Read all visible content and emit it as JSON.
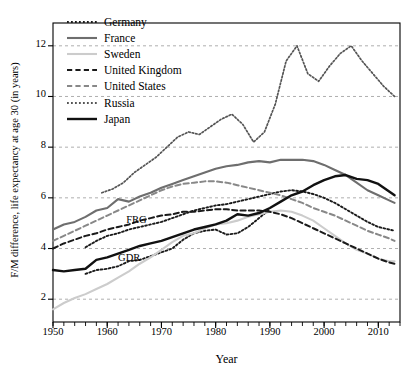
{
  "chart_data": {
    "type": "line",
    "title": "",
    "xlabel": "Year",
    "ylabel": "F/M difference, life expectancy at age 30 (in years)",
    "xlim": [
      1950,
      2014
    ],
    "ylim": [
      1.1,
      12.9
    ],
    "xticks": [
      1950,
      1960,
      1970,
      1980,
      1990,
      2000,
      2010
    ],
    "xtick_labels": [
      "1950",
      "1960",
      "1970",
      "1980",
      "1990",
      "2000",
      "2010"
    ],
    "yticks": [
      2,
      4,
      6,
      8,
      10,
      12
    ],
    "ytick_labels": [
      "2",
      "4",
      "6",
      "8",
      "10",
      "12"
    ],
    "minor_xtick_step": 2,
    "grid": "horizontal-dashed",
    "legend_position": "top-left-inside",
    "annotations": [
      {
        "text": "FRG",
        "x": 1963.5,
        "y": 5.05
      },
      {
        "text": "GDR",
        "x": 1962.0,
        "y": 3.55
      }
    ],
    "series": [
      {
        "name": "Germany",
        "style": "dotted",
        "color": "#1a1a1a",
        "width": 1.9,
        "note": "two branches before reunification: FRG (upper) and GDR (lower)",
        "x": [
          1956,
          1958,
          1960,
          1962,
          1964,
          1966,
          1968,
          1970,
          1972,
          1974,
          1976,
          1978,
          1980,
          1982,
          1984,
          1986,
          1988,
          1990,
          1992,
          1994,
          1996,
          1998,
          2000,
          2002,
          2004,
          2006,
          2008,
          2010,
          2012,
          2013
        ],
        "values": [
          4.05,
          4.3,
          4.5,
          4.6,
          4.75,
          4.85,
          4.95,
          5.05,
          5.2,
          5.35,
          5.5,
          5.6,
          5.7,
          5.75,
          5.85,
          5.95,
          6.05,
          6.15,
          6.25,
          6.3,
          6.25,
          6.15,
          6.0,
          5.8,
          5.55,
          5.3,
          5.05,
          4.85,
          4.75,
          4.7
        ]
      },
      {
        "name": "Germany-GDR-branch",
        "style": "dotted",
        "color": "#1a1a1a",
        "width": 1.9,
        "legend_hidden": true,
        "x": [
          1956,
          1958,
          1960,
          1962,
          1964,
          1966,
          1968,
          1970,
          1972,
          1974,
          1976,
          1978,
          1980,
          1982,
          1984,
          1986,
          1988,
          1990
        ],
        "values": [
          3.0,
          3.15,
          3.2,
          3.3,
          3.5,
          3.55,
          3.7,
          3.85,
          4.0,
          4.35,
          4.6,
          4.7,
          4.75,
          4.55,
          4.6,
          4.85,
          5.2,
          5.55
        ]
      },
      {
        "name": "France",
        "style": "solid",
        "color": "#6e6e6e",
        "width": 2.1,
        "x": [
          1950,
          1952,
          1954,
          1956,
          1958,
          1960,
          1962,
          1964,
          1966,
          1968,
          1970,
          1972,
          1974,
          1976,
          1978,
          1980,
          1982,
          1984,
          1986,
          1988,
          1990,
          1992,
          1994,
          1996,
          1998,
          2000,
          2002,
          2004,
          2006,
          2008,
          2010,
          2012,
          2013
        ],
        "values": [
          4.75,
          4.95,
          5.05,
          5.25,
          5.5,
          5.6,
          5.95,
          5.85,
          6.05,
          6.2,
          6.4,
          6.55,
          6.7,
          6.85,
          7.0,
          7.15,
          7.25,
          7.3,
          7.4,
          7.45,
          7.4,
          7.5,
          7.5,
          7.5,
          7.45,
          7.3,
          7.1,
          6.9,
          6.6,
          6.3,
          6.1,
          5.9,
          5.8
        ]
      },
      {
        "name": "Sweden",
        "style": "solid",
        "color": "#cccccc",
        "width": 2.1,
        "x": [
          1950,
          1952,
          1954,
          1956,
          1958,
          1960,
          1962,
          1964,
          1966,
          1968,
          1970,
          1972,
          1974,
          1976,
          1978,
          1980,
          1982,
          1984,
          1986,
          1988,
          1990,
          1992,
          1994,
          1996,
          1998,
          2000,
          2002,
          2004,
          2006,
          2008,
          2010,
          2012,
          2013
        ],
        "values": [
          1.6,
          1.85,
          2.05,
          2.2,
          2.4,
          2.6,
          2.85,
          3.1,
          3.4,
          3.65,
          3.95,
          4.25,
          4.5,
          4.6,
          4.8,
          4.95,
          5.0,
          5.1,
          5.25,
          5.35,
          5.45,
          5.5,
          5.45,
          5.3,
          5.1,
          4.8,
          4.5,
          4.2,
          3.95,
          3.8,
          3.6,
          3.5,
          3.5
        ]
      },
      {
        "name": "United Kingdom",
        "style": "dashed",
        "color": "#1a1a1a",
        "width": 2.0,
        "x": [
          1950,
          1952,
          1954,
          1956,
          1958,
          1960,
          1962,
          1964,
          1966,
          1968,
          1970,
          1972,
          1974,
          1976,
          1978,
          1980,
          1982,
          1984,
          1986,
          1988,
          1990,
          1992,
          1994,
          1996,
          1998,
          2000,
          2002,
          2004,
          2006,
          2008,
          2010,
          2012,
          2013
        ],
        "values": [
          4.0,
          4.2,
          4.35,
          4.5,
          4.6,
          4.75,
          4.85,
          4.95,
          5.1,
          5.2,
          5.3,
          5.35,
          5.45,
          5.45,
          5.5,
          5.55,
          5.55,
          5.5,
          5.5,
          5.5,
          5.45,
          5.35,
          5.2,
          5.0,
          4.8,
          4.6,
          4.4,
          4.2,
          4.0,
          3.8,
          3.6,
          3.45,
          3.4
        ]
      },
      {
        "name": "United States",
        "style": "dashed",
        "color": "#888888",
        "width": 2.0,
        "x": [
          1950,
          1952,
          1954,
          1956,
          1958,
          1960,
          1962,
          1964,
          1966,
          1968,
          1970,
          1972,
          1974,
          1976,
          1978,
          1980,
          1982,
          1984,
          1986,
          1988,
          1990,
          1992,
          1994,
          1996,
          1998,
          2000,
          2002,
          2004,
          2006,
          2008,
          2010,
          2012,
          2013
        ],
        "values": [
          4.3,
          4.5,
          4.7,
          4.9,
          5.1,
          5.3,
          5.5,
          5.7,
          5.9,
          6.1,
          6.3,
          6.45,
          6.55,
          6.6,
          6.65,
          6.65,
          6.6,
          6.5,
          6.4,
          6.3,
          6.2,
          6.1,
          5.95,
          5.8,
          5.6,
          5.45,
          5.3,
          5.1,
          4.9,
          4.7,
          4.55,
          4.4,
          4.3
        ]
      },
      {
        "name": "Russia",
        "style": "dotted",
        "color": "#555555",
        "width": 1.7,
        "x": [
          1959,
          1961,
          1963,
          1965,
          1967,
          1969,
          1971,
          1973,
          1975,
          1977,
          1979,
          1981,
          1983,
          1985,
          1987,
          1989,
          1991,
          1993,
          1995,
          1997,
          1999,
          2001,
          2003,
          2005,
          2007,
          2009,
          2011,
          2013
        ],
        "values": [
          6.2,
          6.35,
          6.6,
          7.0,
          7.3,
          7.6,
          8.0,
          8.4,
          8.6,
          8.5,
          8.8,
          9.1,
          9.3,
          8.9,
          8.2,
          8.6,
          9.7,
          11.4,
          12.0,
          10.9,
          10.6,
          11.2,
          11.7,
          12.0,
          11.4,
          10.9,
          10.4,
          10.0
        ]
      },
      {
        "name": "Japan",
        "style": "solid",
        "color": "#111111",
        "width": 2.4,
        "x": [
          1950,
          1952,
          1954,
          1956,
          1958,
          1960,
          1962,
          1964,
          1966,
          1968,
          1970,
          1972,
          1974,
          1976,
          1978,
          1980,
          1982,
          1984,
          1986,
          1988,
          1990,
          1992,
          1994,
          1996,
          1998,
          2000,
          2002,
          2004,
          2006,
          2008,
          2010,
          2012,
          2013
        ],
        "values": [
          3.15,
          3.1,
          3.15,
          3.2,
          3.55,
          3.65,
          3.8,
          3.95,
          4.1,
          4.2,
          4.3,
          4.45,
          4.6,
          4.75,
          4.85,
          4.95,
          5.1,
          5.35,
          5.3,
          5.4,
          5.6,
          5.85,
          6.1,
          6.25,
          6.5,
          6.7,
          6.85,
          6.9,
          6.75,
          6.7,
          6.55,
          6.25,
          6.1
        ]
      }
    ]
  },
  "legend": {
    "items": [
      {
        "label": "Germany",
        "style": "dotted",
        "color": "#1a1a1a"
      },
      {
        "label": "France",
        "style": "solid",
        "color": "#6e6e6e"
      },
      {
        "label": "Sweden",
        "style": "solid",
        "color": "#cccccc"
      },
      {
        "label": "United Kingdom",
        "style": "dashed",
        "color": "#1a1a1a"
      },
      {
        "label": "United States",
        "style": "dashed",
        "color": "#888888"
      },
      {
        "label": "Russia",
        "style": "dotted",
        "color": "#555555"
      },
      {
        "label": "Japan",
        "style": "solid",
        "color": "#111111"
      }
    ]
  }
}
